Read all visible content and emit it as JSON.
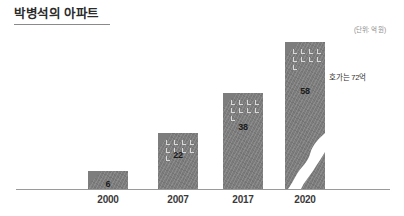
{
  "header": {
    "title": "박병석의 아파트",
    "unit_note": "(단위: 억 원)"
  },
  "annotation": {
    "text": "호가는 72억"
  },
  "chart_data": {
    "type": "bar",
    "title": "박병석의 아파트",
    "unit_note": "(단위: 억 원)",
    "xlabel": "",
    "ylabel": "",
    "grid": false,
    "legend": "none",
    "ylim": [
      0,
      72
    ],
    "categories": [
      "2000",
      "2007",
      "2017",
      "2020"
    ],
    "values": [
      6,
      22,
      38,
      58
    ],
    "annotations": [
      {
        "text": "호가는 72억",
        "attached_to": "2020",
        "value": 72
      }
    ],
    "colors": {
      "bar": "#7d7d7d",
      "bar_value_text": "#1c1c1c",
      "axis_line": "#9a9a9a",
      "title_text": "#2b2b2b",
      "unit_text": "#8d8d8d",
      "annotation_text": "#2f2f2f",
      "window_mark": "#d9d9d9",
      "crack": "#ffffff",
      "background": "#ffffff"
    },
    "bars": [
      {
        "category": "2000",
        "value": 6,
        "label": "6",
        "cracked": false
      },
      {
        "category": "2007",
        "value": 22,
        "label": "22",
        "cracked": false
      },
      {
        "category": "2017",
        "value": 38,
        "label": "38",
        "cracked": false
      },
      {
        "category": "2020",
        "value": 58,
        "label": "58",
        "cracked": true
      }
    ]
  }
}
